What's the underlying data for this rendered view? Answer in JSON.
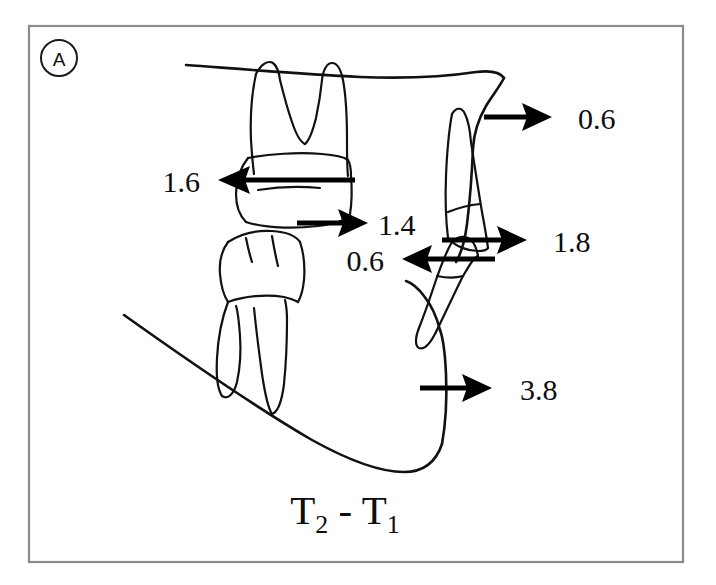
{
  "figure": {
    "panel_label": "A",
    "caption": {
      "base_1": "T",
      "sub_1": "2",
      "separator": " - ",
      "base_2": "T",
      "sub_2": "1",
      "full": "T2 - T1"
    },
    "colors": {
      "ink": "#0d0d0d",
      "line": "#111111",
      "arrow": "#000000",
      "frame": "#8a8a8a",
      "background": "#ffffff"
    }
  },
  "measurements": [
    {
      "id": "upper-molar-mesial",
      "value": "1.6",
      "direction": "left",
      "label_x": 200,
      "label_y": 180,
      "label_anchor": "end",
      "shaft_x1": 355,
      "shaft_x2": 240,
      "shaft_y": 180,
      "head_x": 218,
      "head_y": 180
    },
    {
      "id": "lower-molar-mesial",
      "value": "1.4",
      "direction": "right",
      "label_x": 378,
      "label_y": 223,
      "label_anchor": "start",
      "shaft_x1": 297,
      "shaft_x2": 345,
      "shaft_y": 223,
      "head_x": 368,
      "head_y": 223
    },
    {
      "id": "maxilla-anterior",
      "value": "0.6",
      "direction": "right",
      "label_x": 578,
      "label_y": 117,
      "label_anchor": "start",
      "shaft_x1": 484,
      "shaft_x2": 528,
      "shaft_y": 117,
      "head_x": 552,
      "head_y": 117
    },
    {
      "id": "upper-incisor-anterior",
      "value": "1.8",
      "direction": "right",
      "label_x": 553,
      "label_y": 240,
      "label_anchor": "start",
      "shaft_x1": 442,
      "shaft_x2": 503,
      "shaft_y": 240,
      "head_x": 527,
      "head_y": 240
    },
    {
      "id": "lower-incisor-posterior",
      "value": "0.6",
      "direction": "left",
      "label_x": 384,
      "label_y": 259,
      "label_anchor": "end",
      "shaft_x1": 495,
      "shaft_x2": 426,
      "shaft_y": 259,
      "head_x": 402,
      "head_y": 259
    },
    {
      "id": "mandible-symphysis",
      "value": "3.8",
      "direction": "right",
      "label_x": 520,
      "label_y": 388,
      "label_anchor": "start",
      "shaft_x1": 420,
      "shaft_x2": 468,
      "shaft_y": 388,
      "head_x": 492,
      "head_y": 388
    }
  ]
}
